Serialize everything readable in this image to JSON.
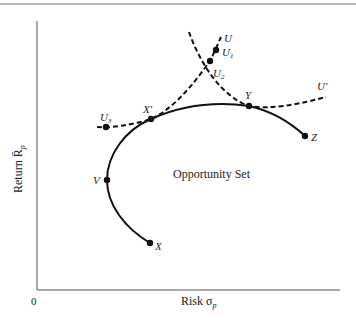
{
  "figure": {
    "region_label": "Opportunity Set",
    "x_axis": {
      "label": "Risk σ",
      "subscript": "p"
    },
    "y_axis": {
      "label": "Return R̄",
      "subscript": "p"
    },
    "origin_label": "0",
    "points": [
      {
        "name": "X",
        "label": "X",
        "x": 150,
        "y": 243
      },
      {
        "name": "V",
        "label": "V",
        "x": 107,
        "y": 180
      },
      {
        "name": "X-prime",
        "label": "X′",
        "x": 151,
        "y": 119
      },
      {
        "name": "Y",
        "label": "Y",
        "x": 249,
        "y": 106
      },
      {
        "name": "Z",
        "label": "Z",
        "x": 305,
        "y": 136
      },
      {
        "name": "U3",
        "label": "U",
        "sub": "3",
        "x": 106,
        "y": 127
      },
      {
        "name": "U1",
        "label": "U",
        "sub": "1",
        "x": 216,
        "y": 50
      },
      {
        "name": "U2",
        "label": "U",
        "sub": "2",
        "x": 210,
        "y": 61
      }
    ],
    "curve_labels": {
      "U": "U",
      "U_prime": "U′"
    },
    "colors": {
      "line": "#111111",
      "axis": "#555555",
      "border": "#666666"
    }
  }
}
